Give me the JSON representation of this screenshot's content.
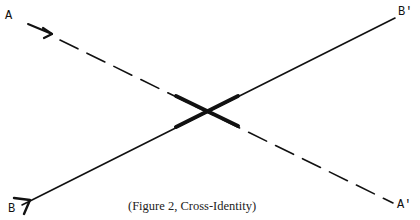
{
  "figure": {
    "caption": "(Figure 2, Cross-Identity)",
    "labels": {
      "a": "A",
      "b": "B",
      "a_prime": "A'",
      "b_prime": "B'"
    },
    "lines": [
      {
        "name": "A to A'",
        "style": "dashed",
        "from": [
          28,
          24
        ],
        "to": [
          393,
          203
        ]
      },
      {
        "name": "B to B'",
        "style": "solid",
        "from": [
          22,
          205
        ],
        "to": [
          395,
          18
        ]
      }
    ],
    "crossing_point": [
      207,
      111
    ],
    "colors": {
      "ink": "#111111",
      "background": "#ffffff"
    }
  }
}
